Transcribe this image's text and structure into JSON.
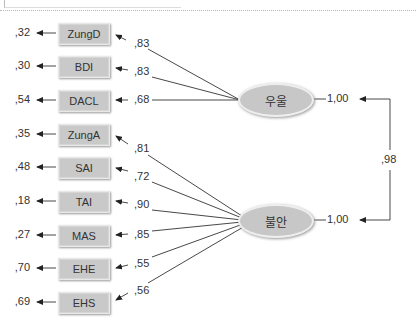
{
  "diagram": {
    "type": "cfa-path-diagram",
    "factors": [
      {
        "label": "우울",
        "variance": "1,00"
      },
      {
        "label": "불안",
        "variance": "1,00"
      }
    ],
    "factor_correlation": ",98",
    "indicators": [
      {
        "label": "ZungD",
        "error": ",32",
        "loading": ",83",
        "factor": "우울"
      },
      {
        "label": "BDI",
        "error": ",30",
        "loading": ",83",
        "factor": "우울"
      },
      {
        "label": "DACL",
        "error": ",54",
        "loading": ",68",
        "factor": "우울"
      },
      {
        "label": "ZungA",
        "error": ",35",
        "loading": ",81",
        "factor": "불안"
      },
      {
        "label": "SAI",
        "error": ",48",
        "loading": ",72",
        "factor": "불안"
      },
      {
        "label": "TAI",
        "error": ",18",
        "loading": ",90",
        "factor": "불안"
      },
      {
        "label": "MAS",
        "error": ",27",
        "loading": ",85",
        "factor": "불안"
      },
      {
        "label": "EHE",
        "error": ",70",
        "loading": ",55",
        "factor": "불안"
      },
      {
        "label": "EHS",
        "error": ",69",
        "loading": ",56",
        "factor": "불안"
      }
    ]
  }
}
